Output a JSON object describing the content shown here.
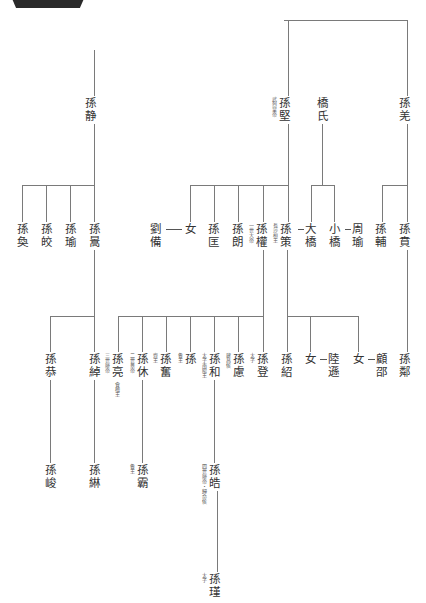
{
  "title_badge": {
    "icon": "title-badge"
  },
  "people": [
    {
      "id": "sun_jing",
      "label": "孫静",
      "x": 90,
      "y": 96
    },
    {
      "id": "sun_jian",
      "label": "孫堅",
      "x": 284,
      "y": 96,
      "note": "武烈皇帝"
    },
    {
      "id": "qiao",
      "label": "橋氏",
      "x": 322,
      "y": 96
    },
    {
      "id": "sun_qiang",
      "label": "孫羌",
      "x": 404,
      "y": 96
    },
    {
      "id": "sun_huan",
      "label": "孫奐",
      "x": 22,
      "y": 222
    },
    {
      "id": "sun_jiao",
      "label": "孫皎",
      "x": 46,
      "y": 222
    },
    {
      "id": "sun_yu",
      "label": "孫瑜",
      "x": 70,
      "y": 222
    },
    {
      "id": "sun_gao",
      "label": "孫暠",
      "x": 94,
      "y": 222
    },
    {
      "id": "liu_bei",
      "label": "劉備",
      "x": 155,
      "y": 222
    },
    {
      "id": "nu1",
      "label": "女",
      "x": 190,
      "y": 222
    },
    {
      "id": "sun_kuang",
      "label": "孫匡",
      "x": 213,
      "y": 222
    },
    {
      "id": "sun_lang",
      "label": "孫朗",
      "x": 237,
      "y": 222
    },
    {
      "id": "sun_quan",
      "label": "孫權",
      "x": 261,
      "y": 222,
      "note": "一世大帝"
    },
    {
      "id": "sun_ce",
      "label": "孫策",
      "x": 285,
      "y": 222,
      "note": "長沙桓王"
    },
    {
      "id": "da_qiao",
      "label": "大橋",
      "x": 310,
      "y": 222
    },
    {
      "id": "xiao_qiao",
      "label": "小橋",
      "x": 334,
      "y": 222
    },
    {
      "id": "zhou_yu",
      "label": "周瑜",
      "x": 357,
      "y": 222
    },
    {
      "id": "sun_fu",
      "label": "孫輔",
      "x": 380,
      "y": 222
    },
    {
      "id": "sun_ben",
      "label": "孫賁",
      "x": 404,
      "y": 222
    },
    {
      "id": "sun_gong",
      "label": "孫恭",
      "x": 50,
      "y": 352
    },
    {
      "id": "sun_chuo",
      "label": "孫綽",
      "x": 94,
      "y": 352
    },
    {
      "id": "sun_liang",
      "label": "孫亮",
      "x": 117,
      "y": 352,
      "note": "三世廢帝",
      "note2": "會稽王"
    },
    {
      "id": "sun_xiu",
      "label": "孫休",
      "x": 142,
      "y": 352,
      "note": "二世景帝"
    },
    {
      "id": "sun_fen",
      "label": "孫奮",
      "x": 165,
      "y": 352,
      "note": "齊王"
    },
    {
      "id": "sun_x",
      "label": "孫",
      "x": 190,
      "y": 352,
      "note": "魯王"
    },
    {
      "id": "sun_he",
      "label": "孫和",
      "x": 214,
      "y": 352,
      "note": "太子南陽王"
    },
    {
      "id": "sun_lu",
      "label": "孫慮",
      "x": 238,
      "y": 352,
      "note": "建昌侯"
    },
    {
      "id": "sun_deng",
      "label": "孫登",
      "x": 262,
      "y": 352,
      "note": "太子"
    },
    {
      "id": "sun_shao",
      "label": "孫紹",
      "x": 286,
      "y": 352
    },
    {
      "id": "nu2",
      "label": "女",
      "x": 310,
      "y": 352
    },
    {
      "id": "lu_xun",
      "label": "陸遜",
      "x": 333,
      "y": 352
    },
    {
      "id": "nu3",
      "label": "女",
      "x": 358,
      "y": 352
    },
    {
      "id": "gu_shao",
      "label": "顧邵",
      "x": 381,
      "y": 352
    },
    {
      "id": "sun_lin2",
      "label": "孫鄰",
      "x": 404,
      "y": 352
    },
    {
      "id": "sun_jun",
      "label": "孫峻",
      "x": 50,
      "y": 463
    },
    {
      "id": "sun_lin",
      "label": "孫綝",
      "x": 94,
      "y": 463
    },
    {
      "id": "sun_hao2",
      "label": "孫霸",
      "x": 142,
      "y": 463,
      "note": "魯王"
    },
    {
      "id": "sun_hao",
      "label": "孫皓",
      "x": 214,
      "y": 463,
      "note": "四世廢帝・歸命侯"
    },
    {
      "id": "sun_jin",
      "label": "孫瑾",
      "x": 214,
      "y": 572,
      "note": "太子"
    }
  ],
  "connections": [
    {
      "type": "marriage",
      "from": "劉備",
      "to": "女"
    },
    {
      "type": "marriage",
      "from": "孫策",
      "to": "大橋"
    },
    {
      "type": "marriage",
      "from": "小橋",
      "to": "周瑜"
    },
    {
      "type": "marriage",
      "from": "女",
      "to": "陸遜"
    },
    {
      "type": "marriage",
      "from": "女",
      "to": "顧邵"
    }
  ]
}
